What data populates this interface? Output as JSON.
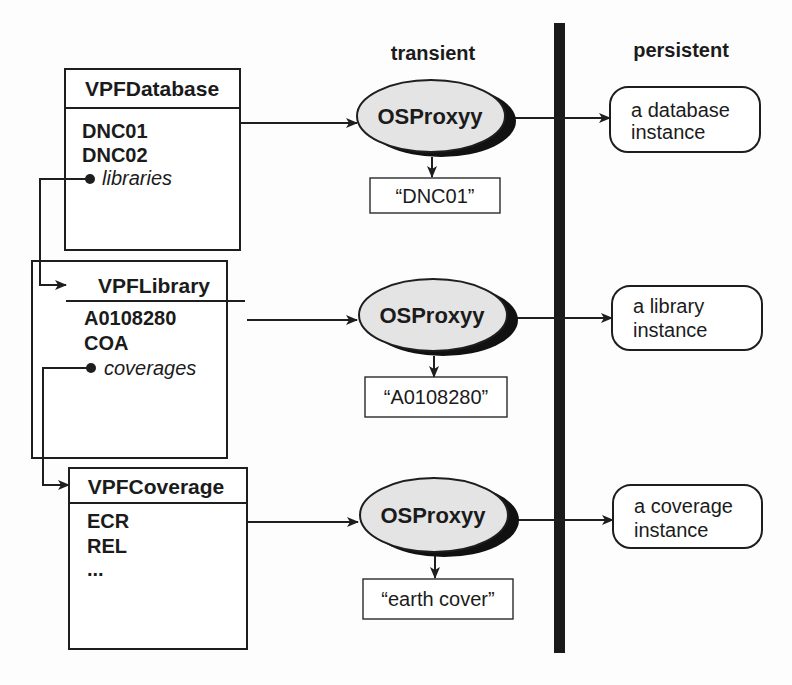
{
  "columns": {
    "transient": "transient",
    "persistent": "persistent"
  },
  "classes": [
    {
      "name": "VPFDatabase",
      "attributes": [
        "DNC01",
        "DNC02"
      ],
      "reference": "libraries"
    },
    {
      "name": "VPFLibrary",
      "attributes": [
        "A0108280",
        "COA"
      ],
      "reference": "coverages"
    },
    {
      "name": "VPFCoverage",
      "attributes": [
        "ECR",
        "REL",
        "..."
      ]
    }
  ],
  "proxies": [
    {
      "label": "OSProxyy",
      "key": "“DNC01”"
    },
    {
      "label": "OSProxyy",
      "key": "“A0108280”"
    },
    {
      "label": "OSProxyy",
      "key": "“earth cover”"
    }
  ],
  "instances": [
    {
      "line1": "a database",
      "line2": "instance"
    },
    {
      "line1": "a library",
      "line2": "instance"
    },
    {
      "line1": "a coverage",
      "line2": "instance"
    }
  ],
  "colors": {
    "ink": "#1e1e1e",
    "ellipse_fill": "#e4e4e4",
    "ellipse_shadow": "#111111",
    "divider": "#1a1a1a",
    "background": "#fdfdfd"
  }
}
